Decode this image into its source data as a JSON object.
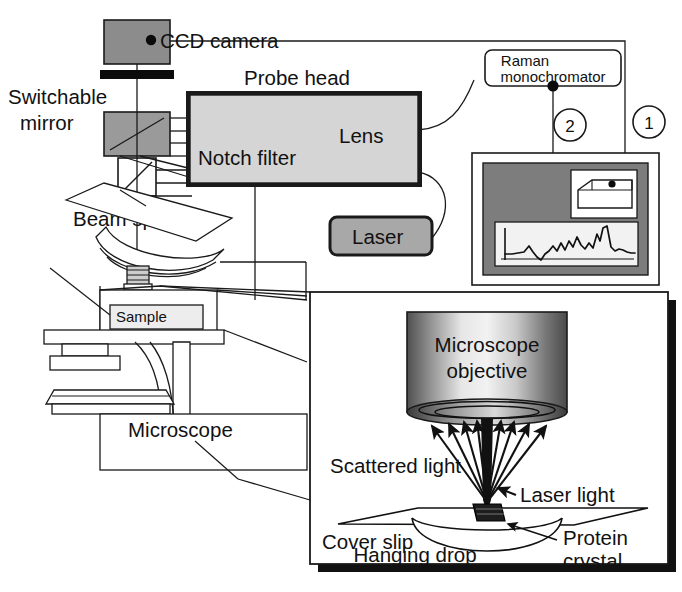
{
  "figure": {
    "width": 682,
    "height": 592
  },
  "colors": {
    "ink": "#111111",
    "line": "#1a1a1a",
    "camera_gray": "#8c8c8c",
    "mirror_gray": "#9a9a9a",
    "probe_fill": "#d5d5d5",
    "laser_fill": "#a8a8a8",
    "monitor_bezel": "#7d7d7d",
    "screen_white": "#f2f2f2",
    "white": "#ffffff",
    "black": "#000000",
    "objective_mid": "#e9e9e9",
    "objective_edge": "#5a5a5a"
  },
  "labels": {
    "ccd_camera": "CCD camera",
    "switchable_mirror_line1": "Switchable",
    "switchable_mirror_line2": "mirror",
    "probe_head": "Probe head",
    "notch_filter": "Notch filter",
    "lens": "Lens",
    "beam_splitter": "Beam splitter",
    "laser": "Laser",
    "raman_line1": "Raman",
    "raman_line2": "monochromator",
    "sample": "Sample",
    "microscope": "Microscope",
    "callout_one": "1",
    "callout_two": "2"
  },
  "inset": {
    "objective_line1": "Microscope",
    "objective_line2": "objective",
    "scattered_light": "Scattered light",
    "laser_light": "Laser light",
    "cover_slip": "Cover slip",
    "hanging_drop": "Hanging drop",
    "protein_line1": "Protein",
    "protein_line2": "crystal"
  },
  "spectrum": {
    "description": "Raman spectrum trace displayed on computer screen",
    "points": "11,46 17,46 23,45 29,44 34,36 38,44 42,50 46,54 50,46 54,42 58,36 62,42 66,33 70,41 74,30 78,38 82,26 86,36 90,41 94,33 98,39 102,22 105,32 108,14 112,12 116,36 120,41 124,38 128,40 132,42 136,44 140,43 144,20 148,34 152,43 156,40 160,44 164,41 168,43"
  }
}
